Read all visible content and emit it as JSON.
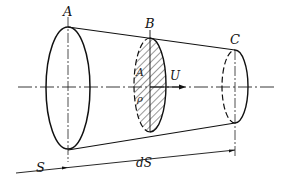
{
  "diagram": {
    "type": "stream-tube",
    "labels": {
      "section_a": "A",
      "section_b": "B",
      "section_c": "C",
      "area": "A",
      "density": "ρ",
      "velocity": "U",
      "position": "S",
      "increment": "dS"
    },
    "colors": {
      "stroke": "#111111",
      "background": "#ffffff"
    }
  }
}
